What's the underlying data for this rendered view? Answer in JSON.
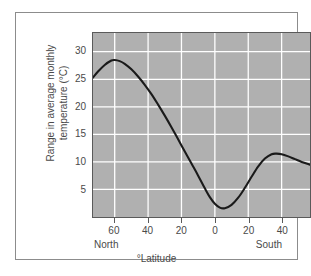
{
  "chart_data": {
    "type": "line",
    "title": "",
    "xlabel": "°Latitude",
    "ylabel_line1": "Range in average monthly",
    "ylabel_line2": "temperature (°C)",
    "left_direction_label": "North",
    "right_direction_label": "South",
    "grid": true,
    "legend": "none",
    "panel_color": "#b0b0b0",
    "grid_color": "#ffffff",
    "line_color": "#1a1a1a",
    "xlim": [
      73,
      -57
    ],
    "ylim": [
      0,
      33.4
    ],
    "xticks": [
      60,
      40,
      20,
      0,
      -20,
      -40
    ],
    "xtick_labels": [
      "60",
      "40",
      "20",
      "0",
      "20",
      "40"
    ],
    "yticks": [
      5,
      10,
      15,
      20,
      25,
      30
    ],
    "ytick_labels": [
      "5",
      "10",
      "15",
      "20",
      "25",
      "30"
    ],
    "x": [
      73,
      70,
      66,
      62,
      60,
      57,
      54,
      50,
      46,
      42,
      38,
      34,
      30,
      26,
      22,
      18,
      14,
      10,
      6,
      3,
      0,
      -3,
      -6,
      -10,
      -14,
      -18,
      -22,
      -26,
      -30,
      -34,
      -37,
      -40,
      -44,
      -48,
      -52,
      -57
    ],
    "y": [
      25.3,
      26.4,
      27.6,
      28.4,
      28.5,
      28.3,
      27.8,
      26.8,
      25.5,
      24.0,
      22.3,
      20.4,
      18.4,
      16.3,
      14.1,
      11.9,
      9.7,
      7.5,
      5.2,
      3.6,
      2.4,
      1.7,
      1.6,
      2.2,
      3.5,
      5.3,
      7.3,
      9.2,
      10.6,
      11.4,
      11.5,
      11.4,
      11.0,
      10.5,
      10.0,
      9.5
    ],
    "annotations": {
      "northern_peak_value": 28.5,
      "northern_peak_latitude": 60,
      "equatorial_minimum_value": 1.6,
      "equatorial_minimum_latitude": -6,
      "southern_peak_value": 11.5,
      "southern_peak_latitude": -37
    }
  }
}
